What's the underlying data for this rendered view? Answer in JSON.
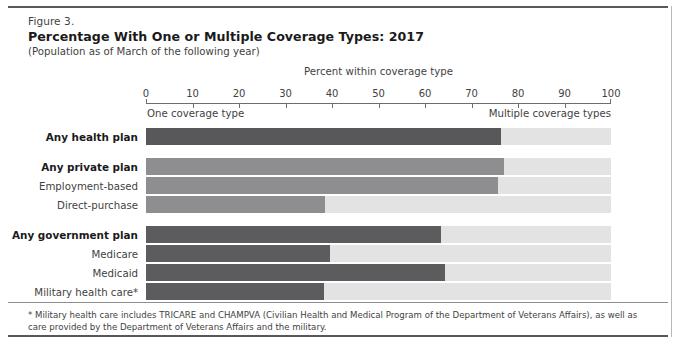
{
  "header": {
    "figure_number": "Figure 3.",
    "title": "Percentage With One or Multiple Coverage Types: 2017",
    "subtitle": "(Population as of March of the following year)"
  },
  "footnote": "* Military health care includes TRICARE and CHAMPVA (Civilian Health and Medical Program of the Department of Veterans Affairs), as well as care provided by the Department of Veterans Affairs and the military.",
  "annotations": {
    "left": "One coverage type",
    "right": "Multiple coverage types"
  },
  "colors": {
    "one_coverage_health": "#58585a",
    "one_coverage_private": "#8e8e90",
    "one_coverage_government": "#5c5c5e",
    "multiple_coverage": "#e3e3e4",
    "rule": "#58585a",
    "text": "#3f3f41"
  },
  "chart_data": {
    "type": "bar",
    "orientation": "horizontal",
    "stacked": true,
    "title": "Percentage With One or Multiple Coverage Types: 2017",
    "subtitle": "(Population as of March of the following year)",
    "xlabel": "Percent within coverage type",
    "ylabel": "",
    "xlim": [
      0,
      100
    ],
    "xticks": [
      0,
      10,
      20,
      30,
      40,
      50,
      60,
      70,
      80,
      90,
      100
    ],
    "xticklabels": [
      "0",
      "10",
      "20",
      "30",
      "40",
      "50",
      "60",
      "70",
      "80",
      "90",
      "100"
    ],
    "grid": false,
    "legend": [
      "One coverage type",
      "Multiple coverage types"
    ],
    "legend_position": "below-axis",
    "categories": [
      "Any health plan",
      "Any private plan",
      "Employment-based",
      "Direct-purchase",
      "Any government plan",
      "Medicare",
      "Medicaid",
      "Military health care*"
    ],
    "series": [
      {
        "name": "One coverage type",
        "values": [
          76.3,
          77.0,
          75.7,
          38.5,
          63.4,
          39.6,
          64.3,
          38.3
        ]
      },
      {
        "name": "Multiple coverage types",
        "values": [
          23.7,
          23.0,
          24.3,
          61.5,
          36.6,
          60.4,
          35.7,
          61.7
        ]
      }
    ]
  },
  "rows": [
    {
      "label": "Any health plan",
      "value": 76.3,
      "tone": "tone-dark",
      "bold": true,
      "gap": false
    },
    {
      "label": "Any private plan",
      "value": 77.0,
      "tone": "tone-mid",
      "bold": true,
      "gap": true
    },
    {
      "label": "Employment-based",
      "value": 75.7,
      "tone": "tone-mid",
      "bold": false,
      "gap": false
    },
    {
      "label": "Direct-purchase",
      "value": 38.5,
      "tone": "tone-mid",
      "bold": false,
      "gap": false
    },
    {
      "label": "Any government plan",
      "value": 63.4,
      "tone": "tone-gov",
      "bold": true,
      "gap": true
    },
    {
      "label": "Medicare",
      "value": 39.6,
      "tone": "tone-gov",
      "bold": false,
      "gap": false
    },
    {
      "label": "Medicaid",
      "value": 64.3,
      "tone": "tone-gov",
      "bold": false,
      "gap": false
    },
    {
      "label": "Military health care*",
      "value": 38.3,
      "tone": "tone-gov",
      "bold": false,
      "gap": false
    }
  ]
}
